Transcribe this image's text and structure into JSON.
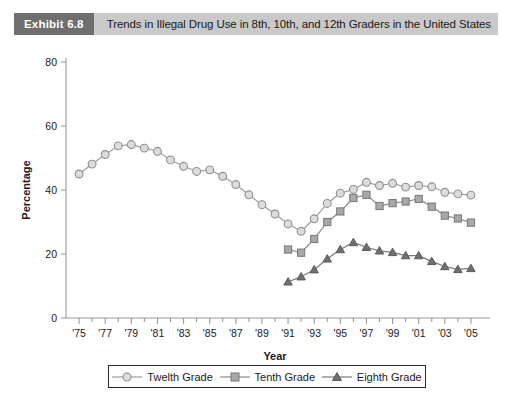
{
  "exhibit": {
    "tag": "Exhibit 6.8",
    "title": "Trends in Illegal Drug Use in 8th, 10th, and 12th Graders in the United States"
  },
  "legend": {
    "items": [
      {
        "label": "Twelth Grade",
        "marker": "circle-marker",
        "color": "#dcdcdc"
      },
      {
        "label": "Tenth Grade",
        "marker": "square-marker",
        "color": "#a8a8a8"
      },
      {
        "label": "Eighth Grade",
        "marker": "triangle-marker",
        "color": "#6f6f6f"
      }
    ]
  },
  "chart_data": {
    "type": "line",
    "title": "Trends in Illegal Drug Use in 8th, 10th, and 12th Graders in the United States",
    "xlabel": "Year",
    "ylabel": "Percentage",
    "xlim": [
      1974,
      2006
    ],
    "ylim": [
      0,
      80
    ],
    "yticks": [
      0,
      20,
      40,
      60,
      80
    ],
    "ytick_labels": [
      "0",
      "20",
      "40",
      "60",
      "80"
    ],
    "xticks": [
      1975,
      1977,
      1979,
      1981,
      1983,
      1985,
      1987,
      1989,
      1991,
      1993,
      1995,
      1997,
      1999,
      2001,
      2003,
      2005
    ],
    "xtick_labels": [
      "'75",
      "'77",
      "'79",
      "'81",
      "'83",
      "'85",
      "'87",
      "'89",
      "'91",
      "'93",
      "'95",
      "'97",
      "'99",
      "'01",
      "'03",
      "'05"
    ],
    "x_minor_ticks": [
      1976,
      1978,
      1980,
      1982,
      1984,
      1986,
      1988,
      1990,
      1992,
      1994,
      1996,
      1998,
      2000,
      2002,
      2004
    ],
    "grid": false,
    "legend_position": "bottom",
    "series": [
      {
        "name": "Twelth Grade",
        "marker": "circle",
        "x": [
          1975,
          1976,
          1977,
          1978,
          1979,
          1980,
          1981,
          1982,
          1983,
          1984,
          1985,
          1986,
          1987,
          1988,
          1989,
          1990,
          1991,
          1992,
          1993,
          1994,
          1995,
          1996,
          1997,
          1998,
          1999,
          2000,
          2001,
          2002,
          2003,
          2004,
          2005
        ],
        "values": [
          45.0,
          48.1,
          51.1,
          53.8,
          54.2,
          53.1,
          52.1,
          49.4,
          47.4,
          45.8,
          46.3,
          44.3,
          41.7,
          38.5,
          35.4,
          32.5,
          29.4,
          27.1,
          31.0,
          35.8,
          39.0,
          40.2,
          42.4,
          41.4,
          42.1,
          40.9,
          41.4,
          41.0,
          39.3,
          38.8,
          38.4
        ]
      },
      {
        "name": "Tenth Grade",
        "marker": "square",
        "x": [
          1991,
          1992,
          1993,
          1994,
          1995,
          1996,
          1997,
          1998,
          1999,
          2000,
          2001,
          2002,
          2003,
          2004,
          2005
        ],
        "values": [
          21.4,
          20.4,
          24.7,
          30.0,
          33.3,
          37.5,
          38.5,
          35.0,
          35.9,
          36.4,
          37.2,
          34.8,
          32.0,
          31.1,
          29.8
        ]
      },
      {
        "name": "Eighth Grade",
        "marker": "triangle",
        "x": [
          1991,
          1992,
          1993,
          1994,
          1995,
          1996,
          1997,
          1998,
          1999,
          2000,
          2001,
          2002,
          2003,
          2004,
          2005
        ],
        "values": [
          11.3,
          12.9,
          15.1,
          18.5,
          21.4,
          23.6,
          22.1,
          21.0,
          20.5,
          19.5,
          19.5,
          17.7,
          16.1,
          15.2,
          15.5
        ]
      }
    ]
  }
}
